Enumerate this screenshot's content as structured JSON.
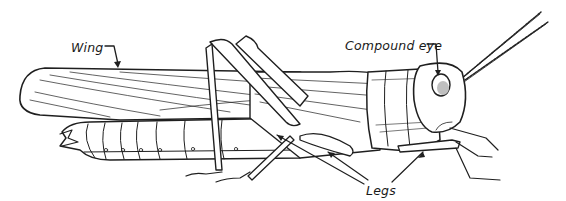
{
  "diagram": {
    "labels": {
      "wing": "Wing",
      "compound_eye": "Compound eye",
      "legs": "Legs"
    },
    "colors": {
      "ink": "#1f1f1f",
      "background": "#ffffff"
    }
  }
}
